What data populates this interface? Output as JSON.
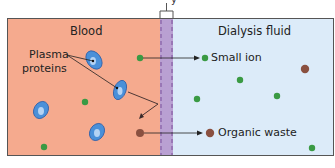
{
  "diagram": {
    "top_fragment": "y",
    "regions": {
      "blood": {
        "label": "Blood",
        "color": "#f5aa8e"
      },
      "membrane": {
        "color": "#b9a0d2",
        "dash_color": "#7a4f9a"
      },
      "dialysis_fluid": {
        "label": "Dialysis fluid",
        "color": "#dcebf9"
      }
    },
    "labels": {
      "plasma_proteins_line1": "Plasma",
      "plasma_proteins_line2": "proteins",
      "small_ion": "Small ion",
      "organic_waste": "Organic waste"
    },
    "colors": {
      "small_ion": "#3a9a44",
      "organic_waste": "#8a5040",
      "protein": "#4a90d9",
      "arrow": "#3a2a2a"
    }
  }
}
